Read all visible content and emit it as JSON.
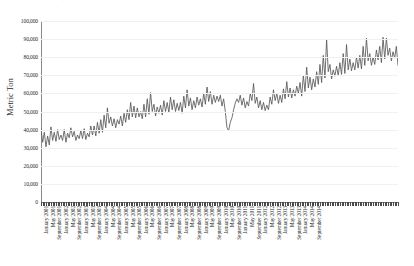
{
  "ghost_top_text": "· · · ·",
  "axis": {
    "ylabel": "Metric Ton",
    "yticks": [
      "0",
      "10,000",
      "20,000",
      "30,000",
      "40,000",
      "50,000",
      "60,000",
      "70,000",
      "80,000",
      "90,000",
      "100,000"
    ]
  },
  "colors": {
    "line": "#58585a",
    "grid": "#f0f0f2",
    "axis": "#8a8a8a",
    "text": "#231f20",
    "background": "#ffffff"
  },
  "chart_data": {
    "type": "line",
    "title": "",
    "xlabel": "",
    "ylabel": "Metric Ton",
    "ylim": [
      0,
      100000
    ],
    "ytick_step": 10000,
    "grid": true,
    "legend": false,
    "markers": false,
    "x_tick_interval_months": 4,
    "x_start": "January 2001",
    "x_end": "December 2014",
    "tick_labels": [
      "January 2001",
      "May 2001",
      "September 2001",
      "January 2002",
      "May 2002",
      "September 2002",
      "January 2003",
      "May 2003",
      "September 2003",
      "January 2004",
      "May 2004",
      "September 2004",
      "January 2005",
      "May 2005",
      "September 2005",
      "January 2006",
      "May 2006",
      "September 2006",
      "January 2007",
      "May 2007",
      "September 2007",
      "January 2008",
      "May 2008",
      "September 2008",
      "January 2009",
      "May 2009",
      "September 2009",
      "January 2010",
      "May 2010",
      "September 2010",
      "January 2011",
      "May 2011",
      "September 2011",
      "January 2012",
      "May 2012",
      "September 2012",
      "January 2013",
      "May 2013",
      "September 2013",
      "January 2014",
      "May 2014",
      "September 2014"
    ],
    "series": [
      {
        "name": "Metric Ton",
        "values": [
          40500,
          33000,
          38500,
          30500,
          36500,
          31500,
          41500,
          34000,
          38500,
          33500,
          40000,
          34500,
          37000,
          34000,
          40000,
          33000,
          38000,
          35500,
          41000,
          36000,
          39000,
          34000,
          37000,
          35000,
          39500,
          35000,
          40500,
          34500,
          38000,
          36000,
          42000,
          37000,
          42000,
          36500,
          44000,
          38000,
          45500,
          38500,
          48000,
          41000,
          52000,
          43500,
          47000,
          42000,
          46000,
          41000,
          45500,
          43000,
          47500,
          42000,
          49000,
          44000,
          51000,
          45500,
          55000,
          47000,
          53000,
          46500,
          52000,
          47000,
          50000,
          46000,
          54000,
          47000,
          57000,
          48500,
          60500,
          50000,
          54000,
          47500,
          52500,
          49000,
          53500,
          48000,
          56000,
          50000,
          55000,
          49500,
          58000,
          51000,
          56500,
          50000,
          54500,
          50500,
          55000,
          49000,
          58500,
          52000,
          62000,
          53000,
          57500,
          51000,
          56000,
          52000,
          58000,
          53500,
          57000,
          52500,
          60000,
          54000,
          63500,
          55500,
          61000,
          54000,
          59000,
          55000,
          58500,
          55500,
          59000,
          53000,
          57000,
          50000,
          41000,
          39500,
          44000,
          46500,
          51000,
          54500,
          57000,
          55000,
          59000,
          53500,
          57500,
          52000,
          55500,
          53000,
          60000,
          56000,
          65500,
          54500,
          58000,
          52000,
          56000,
          51000,
          55000,
          50500,
          53500,
          51000,
          58000,
          54000,
          62000,
          56000,
          60000,
          54500,
          59000,
          55000,
          62500,
          57000,
          66500,
          58000,
          63000,
          57500,
          62000,
          58500,
          64000,
          60000,
          66000,
          58500,
          70000,
          61000,
          74500,
          63000,
          69000,
          62000,
          68000,
          63500,
          72000,
          65000,
          76000,
          66000,
          81000,
          68500,
          90000,
          72000,
          76000,
          68000,
          73000,
          69500,
          75000,
          70000,
          77000,
          70500,
          82000,
          71000,
          87000,
          73000,
          79000,
          72500,
          77000,
          73000,
          80000,
          74000,
          81000,
          73500,
          86000,
          75500,
          90500,
          78000,
          82000,
          75500,
          80000,
          76000,
          84000,
          78500,
          86000,
          77000,
          91000,
          79000,
          90500,
          81000,
          85000,
          78000,
          83000,
          79500,
          86000,
          75500
        ]
      }
    ]
  }
}
